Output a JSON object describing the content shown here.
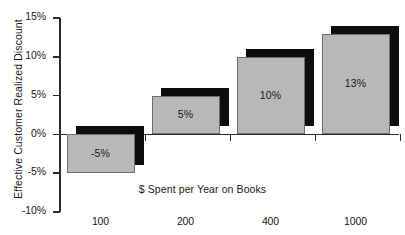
{
  "chart_data": {
    "type": "bar",
    "title": "",
    "xlabel": "$ Spent per Year on Books",
    "ylabel": "Effective Customer Realized Discount",
    "categories": [
      "100",
      "200",
      "400",
      "1000"
    ],
    "values": [
      -5,
      5,
      10,
      13
    ],
    "data_labels": [
      "-5%",
      "5%",
      "10%",
      "13%"
    ],
    "ylim": [
      -10,
      15
    ],
    "ytick_values": [
      15,
      10,
      5,
      0,
      -5,
      -10
    ],
    "ytick_labels": [
      "15%",
      "10%",
      "5%",
      "0%",
      "-5%",
      "-10%"
    ],
    "grid": false,
    "legend": null,
    "series": [
      {
        "name": "Effective Customer Realized Discount",
        "values": [
          -5,
          5,
          10,
          13
        ]
      }
    ],
    "colors": {
      "bar_fill": "#b8b8b8",
      "bar_edge": "#6f6f6f",
      "bar_shadow": "#0d0d0d",
      "axis": "#2b2b2b",
      "text": "#1a1a1a",
      "background": "#ffffff"
    }
  }
}
